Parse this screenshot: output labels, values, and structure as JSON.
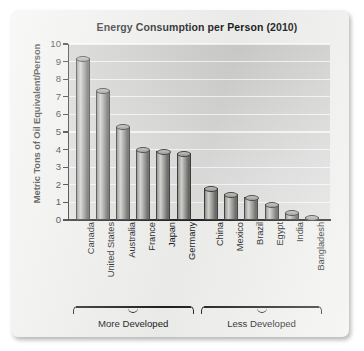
{
  "chart_data": {
    "type": "bar",
    "title": "Energy Consumption per Person (2010)",
    "xlabel": "",
    "ylabel": "Metric Tons of Oil Equivalent/Person",
    "ylim": [
      0,
      10
    ],
    "yticks": [
      "0",
      "1",
      "2",
      "3",
      "4",
      "5",
      "6",
      "7",
      "8",
      "9",
      "10"
    ],
    "grid": true,
    "legend": "none",
    "categories": [
      "Canada",
      "United States",
      "Australia",
      "France",
      "Japan",
      "Germany",
      "China",
      "Mexico",
      "Brazil",
      "Egypt",
      "India",
      "Bangladesh"
    ],
    "values": [
      9.2,
      7.35,
      5.3,
      4.0,
      3.9,
      3.8,
      1.8,
      1.45,
      1.3,
      0.9,
      0.4,
      0.15
    ],
    "annotations": [
      {
        "label": "More Developed",
        "from": "Canada",
        "to": "Germany"
      },
      {
        "label": "Less Developed",
        "from": "China",
        "to": "Bangladesh"
      }
    ]
  },
  "groups": {
    "more_developed": "More Developed",
    "less_developed": "Less Developed"
  },
  "colors": {
    "bar_fill": "#a3a3a0",
    "bar_edge": "#3a3a38",
    "plot_background": "#d6d6d4",
    "gridline": "#ffffff",
    "axis": "#1d1f22",
    "text": "#15171a",
    "page": "#f1f1ef"
  }
}
